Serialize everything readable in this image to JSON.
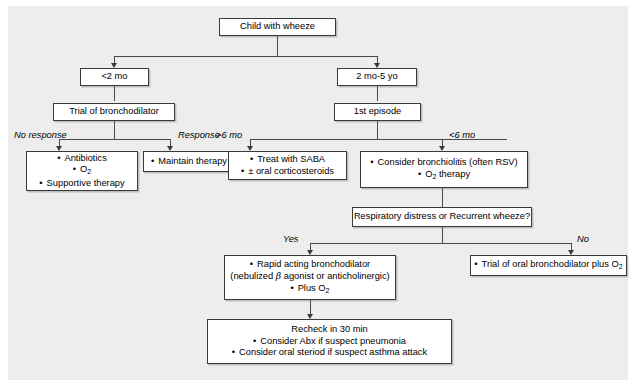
{
  "figure": {
    "background": "#ededed",
    "box_fill": "#ffffff",
    "line_color": "#4a4a4a"
  },
  "nodes": {
    "root": {
      "label": "Child with wheeze"
    },
    "age_lt2mo": {
      "label": "<2 mo"
    },
    "age_2mo5yo": {
      "label": "2 mo-5 yo"
    },
    "trial_bronchodilator": {
      "label": "Trial of bronchodilator"
    },
    "first_episode": {
      "label": "1st episode"
    },
    "no_response_box": {
      "items": [
        "Antibiotics",
        "O₂",
        "Supportive therapy"
      ]
    },
    "maintain_box": {
      "items": [
        "Maintain therapy"
      ]
    },
    "saba_box": {
      "items": [
        "Treat with SABA",
        "± oral corticosteroids"
      ]
    },
    "bronchiolitis_box": {
      "items": [
        "Consider bronchiolitis (often RSV)",
        "O₂ therapy"
      ]
    },
    "question_box": {
      "label": "Respiratory distress or Recurrent wheeze?"
    },
    "rapid_box": {
      "line1": "Rapid acting bronchodilator",
      "line2_pre": "(nebulized ",
      "line2_beta": "β",
      "line2_post": " agonist or anticholinergic)",
      "line3": "Plus O₂"
    },
    "oral_bronchodilator_box": {
      "items": [
        "Trial of oral bronchodilator plus O₂"
      ]
    },
    "recheck_box": {
      "heading": "Recheck in 30 min",
      "items": [
        "Consider Abx if suspect pneumonia",
        "Consider oral steriod if suspect asthma attack"
      ]
    }
  },
  "edge_labels": {
    "no_response": "No response",
    "response": "Response",
    "gt6mo": ">6 mo",
    "lt6mo": "<6 mo",
    "yes": "Yes",
    "no": "No"
  }
}
